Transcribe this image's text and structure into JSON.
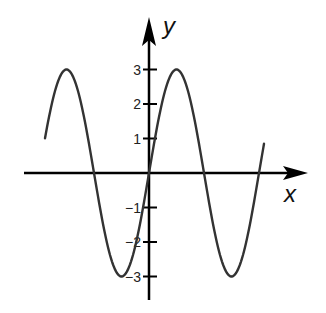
{
  "chart_data": {
    "type": "line",
    "title": "",
    "xlabel": "x",
    "ylabel": "y",
    "function": "y = 3 sin(x)",
    "amplitude": 3,
    "yticks": [
      3,
      2,
      1,
      -1,
      -2,
      -3
    ],
    "ytick_labels": [
      "3",
      "2",
      "1",
      "−1",
      "−2",
      "−3"
    ],
    "ylim": [
      -3.6,
      4.5
    ],
    "grid": false,
    "legend": null,
    "series": [
      {
        "name": "sine curve",
        "x_periods": [
          -1.0,
          1.05
        ],
        "points": [
          {
            "x_frac_period": -1.0,
            "y": 0
          },
          {
            "x_frac_period": -0.75,
            "y": 3
          },
          {
            "x_frac_period": -0.5,
            "y": 0
          },
          {
            "x_frac_period": -0.25,
            "y": -3
          },
          {
            "x_frac_period": 0,
            "y": 0
          },
          {
            "x_frac_period": 0.25,
            "y": 3
          },
          {
            "x_frac_period": 0.5,
            "y": 0
          },
          {
            "x_frac_period": 0.75,
            "y": -3
          },
          {
            "x_frac_period": 1.0,
            "y": 0
          }
        ]
      }
    ]
  },
  "axes": {
    "x_label": "x",
    "y_label": "y"
  }
}
